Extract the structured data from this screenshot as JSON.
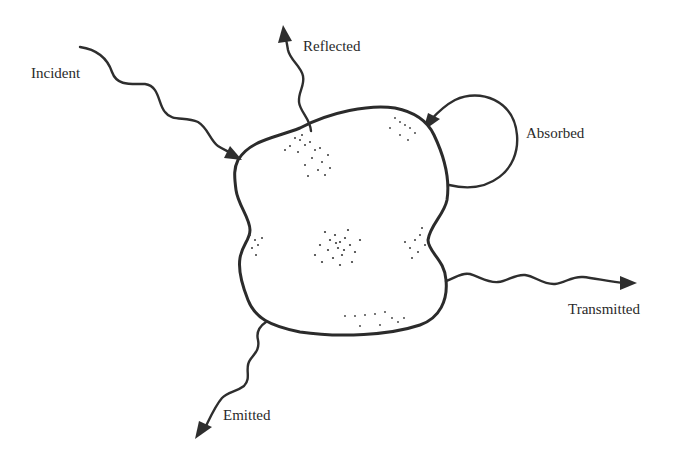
{
  "diagram": {
    "title": "",
    "labels": {
      "incident": "Incident",
      "reflected": "Reflected",
      "absorbed": "Absorbed",
      "transmitted": "Transmitted",
      "emitted": "Emitted"
    },
    "colors": {
      "ink": "#2e2e2e",
      "background": "#ffffff"
    },
    "arrows": [
      {
        "name": "incident",
        "direction": "into body",
        "style": "wavy"
      },
      {
        "name": "reflected",
        "direction": "out of body, upward",
        "style": "wavy"
      },
      {
        "name": "absorbed",
        "direction": "loop back into body",
        "style": "circular"
      },
      {
        "name": "transmitted",
        "direction": "out of body, right",
        "style": "wavy"
      },
      {
        "name": "emitted",
        "direction": "out of body, down-left",
        "style": "wavy"
      }
    ]
  }
}
